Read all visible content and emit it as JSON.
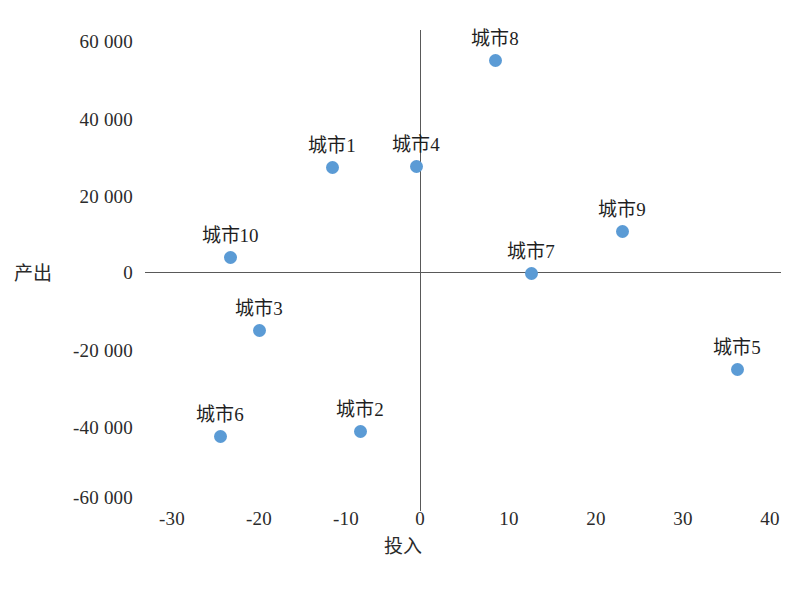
{
  "chart_data": {
    "type": "scatter",
    "title": "",
    "xlabel": "投入",
    "ylabel": "产出",
    "xlim": [
      -30,
      40
    ],
    "ylim": [
      -60000,
      60000
    ],
    "grid": false,
    "legend": "none",
    "x_ticks": [
      "-30",
      "-20",
      "-10",
      "0",
      "10",
      "20",
      "30",
      "40"
    ],
    "x_tick_values": [
      -30,
      -20,
      -10,
      0,
      10,
      20,
      30,
      40
    ],
    "y_ticks": [
      "60 000",
      "40 000",
      "20 000",
      "0",
      "-20 000",
      "-40 000",
      "-60 000"
    ],
    "y_tick_values": [
      60000,
      40000,
      20000,
      0,
      -20000,
      -40000,
      -60000
    ],
    "marker_color": "#5b9bd5",
    "axis_color": "#595959",
    "points": [
      {
        "label": "城市1",
        "x": -10.1,
        "y": 27000,
        "px": 332,
        "py": 167,
        "lx": 332,
        "ly": 136
      },
      {
        "label": "城市2",
        "x": -6.9,
        "y": -42000,
        "px": 360,
        "py": 431,
        "lx": 360,
        "ly": 400
      },
      {
        "label": "城市3",
        "x": -18.4,
        "y": -15000,
        "px": 259,
        "py": 330,
        "lx": 259,
        "ly": 299
      },
      {
        "label": "城市4",
        "x": -0.5,
        "y": 27000,
        "px": 416,
        "py": 166,
        "lx": 416,
        "ly": 135
      },
      {
        "label": "城市5",
        "x": 36.2,
        "y": -25000,
        "px": 737,
        "py": 369,
        "lx": 737,
        "ly": 338
      },
      {
        "label": "城市6",
        "x": -22.9,
        "y": -44000,
        "px": 220,
        "py": 436,
        "lx": 220,
        "ly": 405
      },
      {
        "label": "城市7",
        "x": 12.7,
        "y": 0,
        "px": 531,
        "py": 273,
        "lx": 531,
        "ly": 242
      },
      {
        "label": "城市8",
        "x": 8.6,
        "y": 55000,
        "px": 495,
        "py": 60,
        "lx": 495,
        "ly": 29
      },
      {
        "label": "城市9",
        "x": 23.0,
        "y": 11000,
        "px": 622,
        "py": 231,
        "lx": 622,
        "ly": 200
      },
      {
        "label": "城市10",
        "x": -21.7,
        "y": 4000,
        "px": 230,
        "py": 257,
        "lx": 230,
        "ly": 226
      }
    ],
    "y_tick_positions": [
      {
        "label": "60 000",
        "py": 41
      },
      {
        "label": "40 000",
        "py": 119
      },
      {
        "label": "20 000",
        "py": 196
      },
      {
        "label": "0",
        "py": 272
      },
      {
        "label": "-20 000",
        "py": 350
      },
      {
        "label": "-40 000",
        "py": 427
      },
      {
        "label": "-60 000",
        "py": 497
      }
    ],
    "x_tick_positions": [
      {
        "label": "-30",
        "px": 172
      },
      {
        "label": "-20",
        "px": 259
      },
      {
        "label": "-10",
        "px": 346
      },
      {
        "label": "0",
        "px": 420
      },
      {
        "label": "10",
        "px": 509
      },
      {
        "label": "20",
        "px": 596
      },
      {
        "label": "30",
        "px": 683
      },
      {
        "label": "40",
        "px": 770
      }
    ]
  },
  "caption": ""
}
